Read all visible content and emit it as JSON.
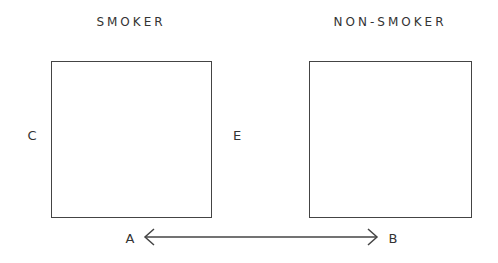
{
  "diagram": {
    "left_panel": {
      "title": "SMOKER",
      "left_label": "C",
      "right_label": "E"
    },
    "right_panel": {
      "title": "NON-SMOKER"
    },
    "arrow": {
      "start_label": "A",
      "end_label": "B",
      "style": "double-headed"
    },
    "colors": {
      "stroke": "#444444",
      "text": "#333333",
      "background": "#ffffff"
    }
  }
}
